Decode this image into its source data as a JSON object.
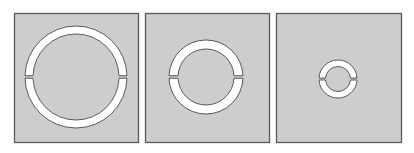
{
  "figure": {
    "background": "#ffffff",
    "panel_fill": "#cdcdcd",
    "panel_stroke": "#5a5a5a",
    "ring_fill": "#ffffff",
    "ring_stroke": "#4a4a4a",
    "panels": [
      {
        "label": "large split ring",
        "x": 14,
        "y": 13,
        "width": 124,
        "height": 129,
        "ring": {
          "cx": 76,
          "cy": 77,
          "r_outer": 51,
          "r_inner": 43,
          "gap": 2.5
        }
      },
      {
        "label": "medium split ring",
        "x": 145,
        "y": 13,
        "width": 124,
        "height": 129,
        "ring": {
          "cx": 206,
          "cy": 77,
          "r_outer": 37,
          "r_inner": 28,
          "gap": 2.5
        }
      },
      {
        "label": "small split ring",
        "x": 276,
        "y": 13,
        "width": 125,
        "height": 129,
        "ring": {
          "cx": 338,
          "cy": 79,
          "r_outer": 19,
          "r_inner": 12.5,
          "gap": 2
        }
      }
    ]
  }
}
